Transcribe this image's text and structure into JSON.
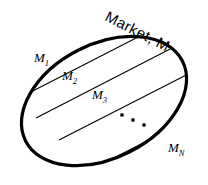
{
  "figure": {
    "type": "set-partition-diagram",
    "title_label": "Market, M",
    "title_rotation_deg": 27,
    "shape": "ellipse",
    "outline_color": "#000000",
    "outline_width_px": 3.2,
    "divider_color": "#000000",
    "divider_width_px": 1.1,
    "background_color": "#ffffff",
    "ellipse": {
      "center_x": 104,
      "center_y": 101,
      "radius_x": 88,
      "radius_y": 57,
      "rotation_deg": -27
    },
    "segments": [
      {
        "id": "m1",
        "base": "M",
        "subscript": "1",
        "label": "M1",
        "x": 34,
        "y": 62
      },
      {
        "id": "m2",
        "base": "M",
        "subscript": "2",
        "label": "M2",
        "x": 62,
        "y": 80
      },
      {
        "id": "m3",
        "base": "M",
        "subscript": "3",
        "label": "M3",
        "x": 92,
        "y": 99
      },
      {
        "id": "mn",
        "base": "M",
        "subscript": "N",
        "label": "MN",
        "x": 168,
        "y": 152
      }
    ],
    "ellipsis": {
      "name": "ellipsis-dots",
      "count": 3,
      "dots": [
        {
          "cx": 122,
          "cy": 115
        },
        {
          "cx": 133,
          "cy": 120
        },
        {
          "cx": 144,
          "cy": 125
        }
      ]
    },
    "dividers": [
      {
        "id": "divider-1",
        "x1": 18,
        "y1": 76,
        "x2": 92,
        "y2": 38
      },
      {
        "id": "divider-2",
        "x1": 23,
        "y1": 96,
        "x2": 140,
        "y2": 36
      },
      {
        "id": "divider-3",
        "x1": 36,
        "y1": 118,
        "x2": 174,
        "y2": 47
      },
      {
        "id": "divider-4",
        "x1": 59,
        "y1": 140,
        "x2": 190,
        "y2": 73
      },
      {
        "id": "divider-5",
        "x1": 104,
        "y1": 163,
        "x2": 196,
        "y2": 116
      }
    ]
  }
}
